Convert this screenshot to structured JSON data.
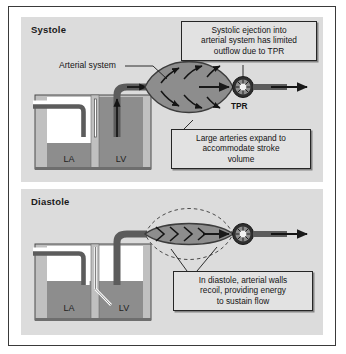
{
  "figure": {
    "type": "physiology-diagram",
    "colors": {
      "panel_background": "#dcdcdc",
      "frame_border": "#3a3a3a",
      "blood_fill": "#8d8d8d",
      "vessel_wall": "#5c5c5c",
      "callout_background": "#e2e2e2",
      "callout_border": "#262626",
      "chamber_wall": "#c0c0c0",
      "chamber_empty": "#ffffff",
      "arrow": "#1a1a1a"
    }
  },
  "panels": [
    {
      "id": "systole",
      "title": "Systole",
      "chambers": [
        {
          "label": "LA",
          "state": "partially-filled"
        },
        {
          "label": "LV",
          "state": "full-contracting"
        }
      ],
      "valve_state": "closed",
      "artery_state": "expanded",
      "labels": [
        {
          "name": "arterial-system",
          "text": "Arterial system"
        },
        {
          "name": "tpr",
          "text": "TPR"
        }
      ],
      "callouts": [
        {
          "name": "systolic-ejection-callout",
          "lines": [
            "Systolic ejection into",
            "arterial system has limited",
            "outflow due to TPR"
          ]
        },
        {
          "name": "large-arteries-callout",
          "lines": [
            "Large arteries expand to",
            "accommodate stroke",
            "volume"
          ]
        }
      ]
    },
    {
      "id": "diastole",
      "title": "Diastole",
      "chambers": [
        {
          "label": "LA",
          "state": "filled"
        },
        {
          "label": "LV",
          "state": "filling"
        }
      ],
      "valve_state": "open",
      "artery_state": "recoiled",
      "labels": [],
      "callouts": [
        {
          "name": "diastolic-recoil-callout",
          "lines": [
            "In diastole, arterial walls",
            "recoil, providing energy",
            "to sustain flow"
          ]
        }
      ]
    }
  ]
}
